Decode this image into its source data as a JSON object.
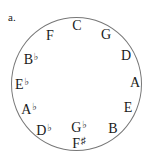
{
  "figure_label": "a.",
  "diagram": {
    "notes": [
      {
        "id": "c",
        "letter": "C",
        "accidental": "",
        "x": 77,
        "y": 26
      },
      {
        "id": "g",
        "letter": "G",
        "accidental": "",
        "x": 106,
        "y": 35
      },
      {
        "id": "d",
        "letter": "D",
        "accidental": "",
        "x": 126,
        "y": 56
      },
      {
        "id": "a",
        "letter": "A",
        "accidental": "",
        "x": 135,
        "y": 83
      },
      {
        "id": "e",
        "letter": "E",
        "accidental": "",
        "x": 128,
        "y": 108
      },
      {
        "id": "b",
        "letter": "B",
        "accidental": "",
        "x": 113,
        "y": 129
      },
      {
        "id": "gb",
        "letter": "G",
        "accidental": "♭",
        "x": 79,
        "y": 126
      },
      {
        "id": "fs",
        "letter": "F",
        "accidental": "♯",
        "x": 79,
        "y": 142
      },
      {
        "id": "db",
        "letter": "D",
        "accidental": "♭",
        "x": 44,
        "y": 129
      },
      {
        "id": "ab",
        "letter": "A",
        "accidental": "♭",
        "x": 29,
        "y": 108
      },
      {
        "id": "eb",
        "letter": "E",
        "accidental": "♭",
        "x": 22,
        "y": 83
      },
      {
        "id": "bb",
        "letter": "B",
        "accidental": "♭",
        "x": 31,
        "y": 58
      },
      {
        "id": "f",
        "letter": "F",
        "accidental": "",
        "x": 50,
        "y": 36
      }
    ]
  }
}
